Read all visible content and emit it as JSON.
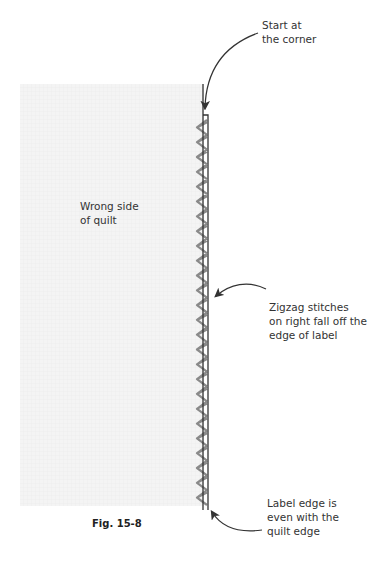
{
  "figure": {
    "caption": "Fig. 15-8",
    "quilt_label": "Wrong side\nof quilt",
    "callouts": {
      "start": "Start at\nthe corner",
      "zigzag": "Zigzag stitches\non right fall off the\nedge of label",
      "edge": "Label edge is\neven with the\nquilt edge"
    }
  },
  "colors": {
    "quilt_fill": "#f3f3f3",
    "quilt_grid": "#ececec",
    "line": "#333333",
    "stitch": "#8a8a8a",
    "text": "#333333"
  },
  "geometry": {
    "quilt": {
      "x": 20,
      "y": 84,
      "w": 184,
      "h": 422
    },
    "stitch_count": 26
  }
}
